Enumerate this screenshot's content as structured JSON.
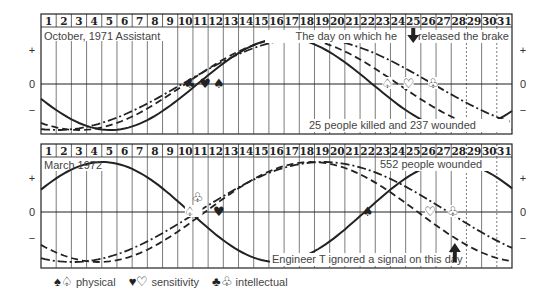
{
  "chart_data": [
    {
      "type": "line",
      "title": "October, 1971 Assistant",
      "days": [
        1,
        2,
        3,
        4,
        5,
        6,
        7,
        8,
        9,
        10,
        11,
        12,
        13,
        14,
        15,
        16,
        17,
        18,
        19,
        20,
        21,
        22,
        23,
        24,
        25,
        26,
        27,
        28,
        29,
        30,
        31
      ],
      "dashed_day_columns": [
        29,
        31
      ],
      "yticks": [
        "+",
        "0",
        "−"
      ],
      "annotations": [
        {
          "text": "The day on which he released the brake",
          "day": 25,
          "marker": "down-arrow"
        },
        {
          "text": "25 people killed and 237 wounded"
        }
      ],
      "series": [
        {
          "name": "physical",
          "style": "solid",
          "period_days": 23,
          "min_day": 5,
          "max_day": 16.5,
          "zero_cross_up_day": 10.8,
          "zero_cross_down_day": 22.2
        },
        {
          "name": "sensitivity",
          "style": "dashed",
          "period_days": 28,
          "min_day": 3,
          "max_day": 17,
          "zero_cross_up_day": 10,
          "zero_cross_down_day": 24.2
        },
        {
          "name": "intellectual",
          "style": "dash-dot",
          "period_days": 33,
          "min_day": 2.5,
          "max_day": 17,
          "zero_cross_up_day": 9.8,
          "zero_cross_down_day": 25.8
        }
      ],
      "critical_markers": [
        {
          "day": 10.3,
          "series": "intellectual",
          "symbol": "♣"
        },
        {
          "day": 11.3,
          "series": "sensitivity",
          "symbol": "♥"
        },
        {
          "day": 12.2,
          "series": "physical",
          "symbol": "♠"
        },
        {
          "day": 23.3,
          "series": "physical",
          "symbol": "♤"
        },
        {
          "day": 24.7,
          "series": "sensitivity",
          "symbol": "♡"
        },
        {
          "day": 26.3,
          "series": "intellectual",
          "symbol": "♧"
        }
      ]
    },
    {
      "type": "line",
      "title": "March 1972",
      "days": [
        1,
        2,
        3,
        4,
        5,
        6,
        7,
        8,
        9,
        10,
        11,
        12,
        13,
        14,
        15,
        16,
        17,
        18,
        19,
        20,
        21,
        22,
        23,
        24,
        25,
        26,
        27,
        28,
        29,
        30,
        31
      ],
      "dashed_day_columns": [
        29,
        31
      ],
      "yticks": [
        "+",
        "0",
        "−"
      ],
      "annotations": [
        {
          "text": "552 people wounded"
        },
        {
          "text": "Engineer T ignored a signal on this day",
          "day": 28,
          "marker": "up-arrow"
        }
      ],
      "series": [
        {
          "name": "physical",
          "style": "solid",
          "period_days": 23,
          "max_day": 4.5,
          "min_day": 16,
          "zero_cross_down_day": 10.3,
          "zero_cross_up_day": 21.8
        },
        {
          "name": "sensitivity",
          "style": "dashed",
          "period_days": 28,
          "min_day": 5,
          "max_day": 17.5,
          "zero_cross_up_day": 11.3,
          "zero_cross_down_day": 25.3
        },
        {
          "name": "intellectual",
          "style": "dash-dot",
          "period_days": 33,
          "min_day": 4,
          "max_day": 18,
          "zero_cross_up_day": 10.8,
          "zero_cross_down_day": 27.5
        }
      ],
      "critical_markers": [
        {
          "day": 10.3,
          "series": "physical",
          "symbol": "♤"
        },
        {
          "day": 10.8,
          "series": "intellectual",
          "symbol": "♧"
        },
        {
          "day": 12.2,
          "series": "sensitivity",
          "symbol": "♥"
        },
        {
          "day": 22,
          "series": "physical",
          "symbol": "♠"
        },
        {
          "day": 26.1,
          "series": "sensitivity",
          "symbol": "♡"
        },
        {
          "day": 27.6,
          "series": "intellectual",
          "symbol": "♧"
        }
      ]
    }
  ],
  "panels": [
    {
      "title": "October, 1971 Assistant",
      "note_top": "The day on which he",
      "note_top2": "released the brake",
      "note_bottom": "25 people killed and 237 wounded",
      "plus": "+",
      "zero": "0",
      "minus": "−"
    },
    {
      "title": "March 1972",
      "note_top": "552 people wounded",
      "note_bottom": "Engineer T ignored a signal on this day",
      "plus": "+",
      "zero": "0",
      "minus": "−"
    }
  ],
  "legend": {
    "physical_symbols": "♠♤",
    "physical_label": "physical",
    "sensitivity_symbols": "♥♡",
    "sensitivity_label": "sensitivity",
    "intellectual_symbols": "♣♧",
    "intellectual_label": "intellectual"
  },
  "colors": {
    "ink": "#222222",
    "grid": "#555555",
    "text": "#444444"
  }
}
